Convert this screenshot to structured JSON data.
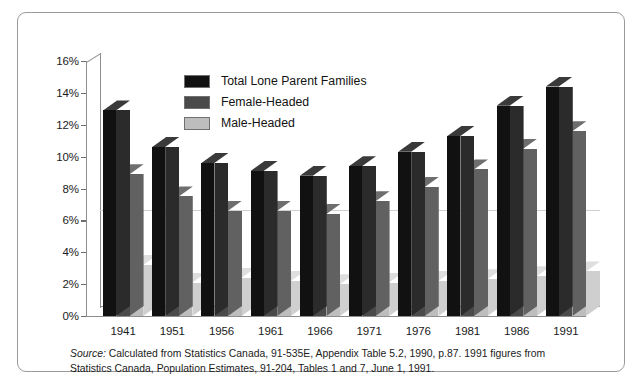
{
  "chart_data": {
    "type": "bar",
    "title": "",
    "subtitle": "",
    "xlabel": "",
    "ylabel": "",
    "categories": [
      "1941",
      "1951",
      "1956",
      "1961",
      "1966",
      "1971",
      "1976",
      "1981",
      "1986",
      "1991"
    ],
    "series": [
      {
        "name": "Total Lone Parent Families",
        "color": "#111111",
        "side_color": "#2b2b2b",
        "top_color": "#3a3a3a",
        "values": [
          12.9,
          10.6,
          9.6,
          9.1,
          8.8,
          9.4,
          10.3,
          11.3,
          13.2,
          14.4
        ]
      },
      {
        "name": "Female-Headed",
        "color": "#4a4a4a",
        "side_color": "#616161",
        "top_color": "#6e6e6e",
        "values": [
          8.9,
          7.5,
          6.6,
          6.6,
          6.4,
          7.2,
          8.1,
          9.2,
          10.5,
          11.6
        ]
      },
      {
        "name": "Male-Headed",
        "color": "#bdbdbd",
        "side_color": "#cfcfcf",
        "top_color": "#dedede",
        "values": [
          3.2,
          2.1,
          2.4,
          2.2,
          2.0,
          2.1,
          2.2,
          2.3,
          2.5,
          2.8
        ]
      }
    ],
    "ylim": [
      0,
      16
    ],
    "ytick_values": [
      0,
      2,
      4,
      6,
      8,
      10,
      12,
      14,
      16
    ],
    "ytick_labels": [
      "0%",
      "2%",
      "4%",
      "6%",
      "8%",
      "10%",
      "12%",
      "14%",
      "16%"
    ],
    "grid": true,
    "grid_at": [
      6
    ],
    "legend_position": "upper-center",
    "three_d": true
  },
  "legend": {
    "items": [
      {
        "label": "Total Lone Parent Families",
        "color": "#111111"
      },
      {
        "label": "Female-Headed",
        "color": "#4a4a4a"
      },
      {
        "label": "Male-Headed",
        "color": "#bdbdbd"
      }
    ]
  },
  "source": {
    "lead": "Source:",
    "line1": "Calculated from Statistics Canada, 91-535E, Appendix Table 5.2, 1990, p.87. 1991 figures from",
    "line2": "Statistics Canada, Population Estimates, 91-204, Tables 1 and 7, June 1, 1991."
  },
  "colors": {
    "frame": "#9a9a9a",
    "axis": "#8d8d8d",
    "gridline": "#cfcfcf",
    "background": "#ffffff",
    "text": "#1b1b1b"
  }
}
